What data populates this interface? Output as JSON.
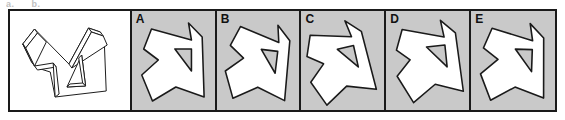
{
  "clipped_header": {
    "fragment_left": "a.",
    "fragment_right": "b."
  },
  "colors": {
    "frame_border": "#1a1a1a",
    "stimulus_background": "#ffffff",
    "option_background": "#c9c9c9",
    "figure_fill": "#ffffff",
    "figure_stroke": "#1a1a1a",
    "letter_color": "#111111"
  },
  "stimulus": {
    "name": "three-dimensional-reference-figure",
    "description": "3D line-drawing of an arrow-like folded polygon with a triangular cut-out, drawn with thin outline only, no shading",
    "fill": "#ffffff",
    "stroke": "#1a1a1a"
  },
  "options": [
    {
      "letter": "A",
      "description": "flat arrow-like polygon with triangular hole, upright orientation",
      "rotation_deg": 0
    },
    {
      "letter": "B",
      "description": "flat arrow-like polygon with triangular hole, slightly rotated clockwise",
      "rotation_deg": 8
    },
    {
      "letter": "C",
      "description": "flat arrow-like polygon with triangular hole, rotated counter-clockwise and shifted left",
      "rotation_deg": -14
    },
    {
      "letter": "D",
      "description": "flat arrow-like polygon with triangular hole, mirrored variant",
      "rotation_deg": -6
    },
    {
      "letter": "E",
      "description": "flat arrow-like polygon with triangular hole, upright orientation",
      "rotation_deg": 2
    }
  ]
}
